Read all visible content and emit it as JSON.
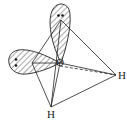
{
  "diagram": {
    "labels": {
      "oxygen": "O",
      "hydrogen_right": "H",
      "hydrogen_bottom": "H"
    },
    "colors": {
      "line": "#222222",
      "background": "#ffffff"
    },
    "lone_pairs": [
      {
        "name": "top-lone-pair",
        "electrons": 2
      },
      {
        "name": "left-lone-pair",
        "electrons": 2
      }
    ]
  }
}
